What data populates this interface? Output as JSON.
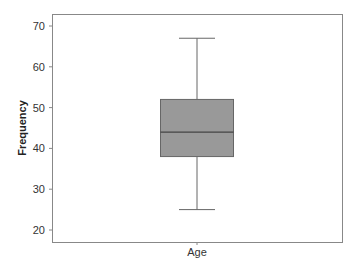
{
  "chart_data": {
    "type": "boxplot",
    "title": "",
    "xlabel": "",
    "ylabel": "Frequency",
    "categories": [
      "Age"
    ],
    "series": [
      {
        "name": "Age",
        "min": 25,
        "q1": 38,
        "median": 44,
        "q3": 52,
        "max": 67
      }
    ],
    "ylim": [
      17.5,
      73
    ],
    "yticks": [
      20,
      30,
      40,
      50,
      60,
      70
    ],
    "grid": false,
    "legend": null,
    "box_color": "#999999"
  },
  "labels": {
    "ylabel": "Frequency",
    "category": "Age",
    "yticks": [
      "20",
      "30",
      "40",
      "50",
      "60",
      "70"
    ]
  }
}
